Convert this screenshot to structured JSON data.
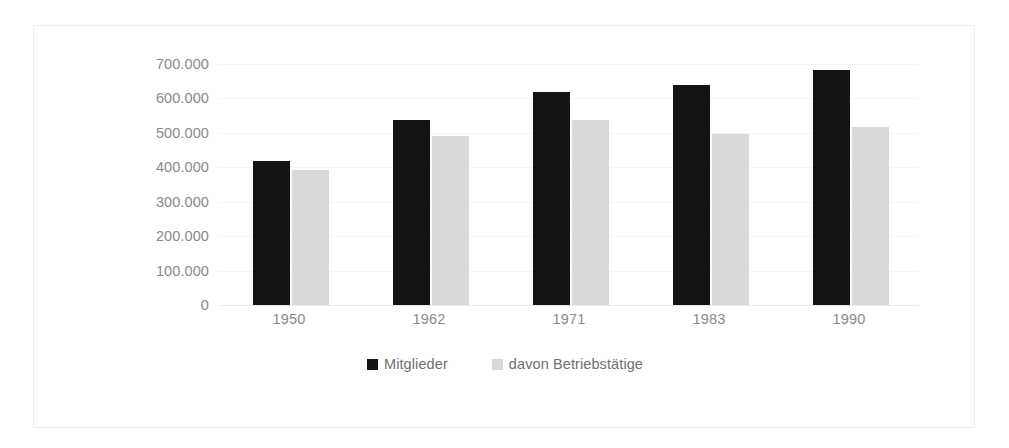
{
  "chart_data": {
    "type": "bar",
    "title": "",
    "subtitle": "",
    "xlabel": "",
    "ylabel": "",
    "categories": [
      "1950",
      "1962",
      "1971",
      "1983",
      "1990"
    ],
    "series": [
      {
        "name": "Mitglieder",
        "color": "#141414",
        "values": [
          418000,
          536000,
          618000,
          640000,
          682000
        ]
      },
      {
        "name": "davon Betriebstätige",
        "color": "#d9d9d9",
        "values": [
          391000,
          491000,
          536000,
          497000,
          518000
        ]
      }
    ],
    "ylim": [
      0,
      700000
    ],
    "ytick_values": [
      700000,
      600000,
      500000,
      400000,
      300000,
      200000,
      100000,
      0
    ],
    "ytick_labels": [
      "700.000",
      "600.000",
      "500.000",
      "400.000",
      "300.000",
      "200.000",
      "100.000",
      "0"
    ],
    "grid": true,
    "legend_position": "bottom",
    "border_color": "#eceef0",
    "grid_color": "#f4f5f6",
    "axis_color": "#e9eaec",
    "tick_label_color": "#8a8a8a",
    "legend_label_color": "#6f6f6f"
  }
}
